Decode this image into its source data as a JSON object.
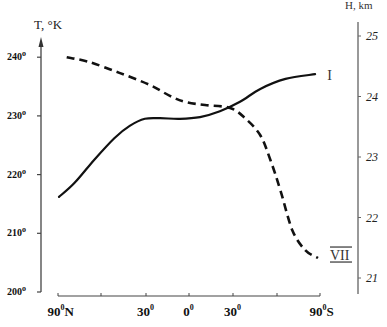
{
  "chart_data": {
    "type": "line",
    "title": "",
    "left_axis": {
      "label": "T, °K",
      "range": [
        200,
        245
      ],
      "ticks": [
        {
          "value": 200,
          "label": "200",
          "sup": "o"
        },
        {
          "value": 210,
          "label": "210",
          "sup": "o"
        },
        {
          "value": 220,
          "label": "220",
          "sup": "o"
        },
        {
          "value": 230,
          "label": "230",
          "sup": "o"
        },
        {
          "value": 240,
          "label": "240",
          "sup": "o"
        }
      ]
    },
    "right_axis": {
      "label": "H, km",
      "range": [
        20.7,
        25.2
      ],
      "ticks": [
        {
          "value": 21,
          "label": "21"
        },
        {
          "value": 22,
          "label": "22"
        },
        {
          "value": 23,
          "label": "23"
        },
        {
          "value": 24,
          "label": "24"
        },
        {
          "value": 25,
          "label": "25"
        }
      ]
    },
    "x_axis": {
      "label": "",
      "ticks": [
        {
          "lat": 90,
          "label": "90",
          "sup": "0",
          "suffix": "N"
        },
        {
          "lat": 60,
          "label": "",
          "sup": "",
          "suffix": ""
        },
        {
          "lat": 30,
          "label": "30",
          "sup": "0",
          "suffix": ""
        },
        {
          "lat": 0,
          "label": "0",
          "sup": "0",
          "suffix": ""
        },
        {
          "lat": -30,
          "label": "30",
          "sup": "0",
          "suffix": ""
        },
        {
          "lat": -60,
          "label": "",
          "sup": "",
          "suffix": ""
        },
        {
          "lat": -90,
          "label": "90",
          "sup": "0",
          "suffix": "S"
        }
      ]
    },
    "series": [
      {
        "name": "I",
        "label": "I",
        "axis": "left",
        "style": "solid",
        "points": [
          [
            89.3,
            216.2
          ],
          [
            78.4,
            218.6
          ],
          [
            64.8,
            222.5
          ],
          [
            51.1,
            226.2
          ],
          [
            40.9,
            228.3
          ],
          [
            30.7,
            229.5
          ],
          [
            20.2,
            229.6
          ],
          [
            6.3,
            229.5
          ],
          [
            -7.5,
            229.8
          ],
          [
            -21.1,
            230.8
          ],
          [
            -34.8,
            232.4
          ],
          [
            -48.6,
            234.6
          ],
          [
            -65.9,
            236.3
          ],
          [
            -86.6,
            237.1
          ]
        ]
      },
      {
        "name": "VII",
        "label": "VII",
        "axis": "right",
        "style": "dashed",
        "points": [
          [
            83.9,
            24.65
          ],
          [
            68.2,
            24.57
          ],
          [
            47.7,
            24.39
          ],
          [
            27.2,
            24.19
          ],
          [
            13.3,
            24.01
          ],
          [
            2.8,
            23.91
          ],
          [
            -10.9,
            23.86
          ],
          [
            -28.0,
            23.81
          ],
          [
            -38.3,
            23.64
          ],
          [
            -48.6,
            23.36
          ],
          [
            -55.5,
            22.95
          ],
          [
            -62.4,
            22.45
          ],
          [
            -70.7,
            21.79
          ],
          [
            -79.7,
            21.46
          ],
          [
            -88.6,
            21.33
          ]
        ]
      }
    ],
    "grid": false,
    "legend": "inline labels at right end of curves"
  }
}
